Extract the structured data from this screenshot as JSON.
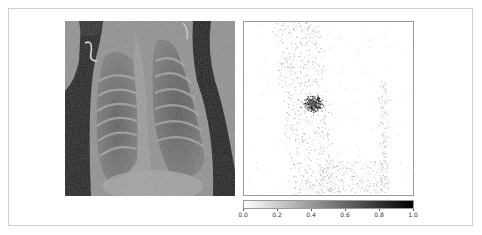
{
  "figure": {
    "left_panel": {
      "description": "Chest X-ray image (grayscale)"
    },
    "right_panel": {
      "description": "Attribution / saliency map (grayscale, dark = high)"
    }
  },
  "chart_data": {
    "type": "heatmap",
    "title": "",
    "xlabel": "",
    "ylabel": "",
    "colormap": "gray_r",
    "colorbar": {
      "range": [
        0.0,
        1.0
      ],
      "ticks": [
        0.0,
        0.2,
        0.4,
        0.6,
        0.8,
        1.0
      ],
      "tick_labels": [
        "0.0",
        "0.2",
        "0.4",
        "0.6",
        "0.8",
        "1.0"
      ],
      "orientation": "horizontal",
      "position": "below right panel"
    },
    "hotspot": {
      "approx_center_fraction": [
        0.41,
        0.47
      ],
      "description": "dense high-attribution cluster in left-center of lung field"
    }
  },
  "colors": {
    "frame_border": "#cfcfcf",
    "axes_border": "#9a9a9a",
    "cbar_low": "#ffffff",
    "cbar_high": "#000000"
  }
}
